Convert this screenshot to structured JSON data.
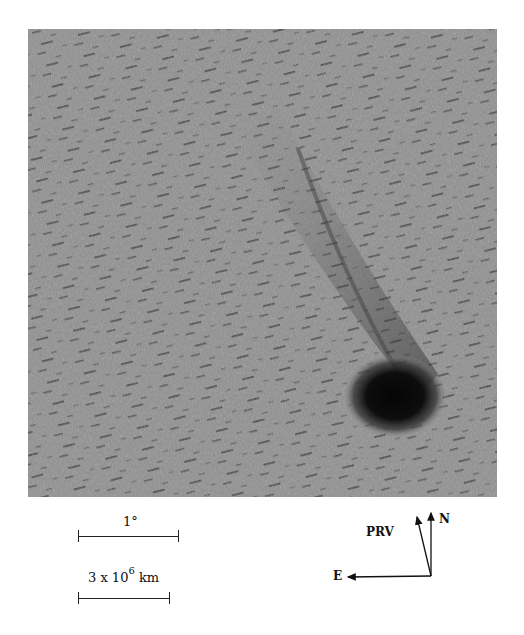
{
  "figure": {
    "colors": {
      "sky": "#8f8f8f",
      "nucleus": "#0b0b0b",
      "streak": "#3a3a3a"
    }
  },
  "scales": {
    "angular": {
      "label": "1°"
    },
    "linear": {
      "label_base": "3 x 10",
      "label_exp": "6",
      "label_unit": "km"
    }
  },
  "compass": {
    "north_label": "N",
    "prv_label": "PRV",
    "east_label": "E"
  }
}
